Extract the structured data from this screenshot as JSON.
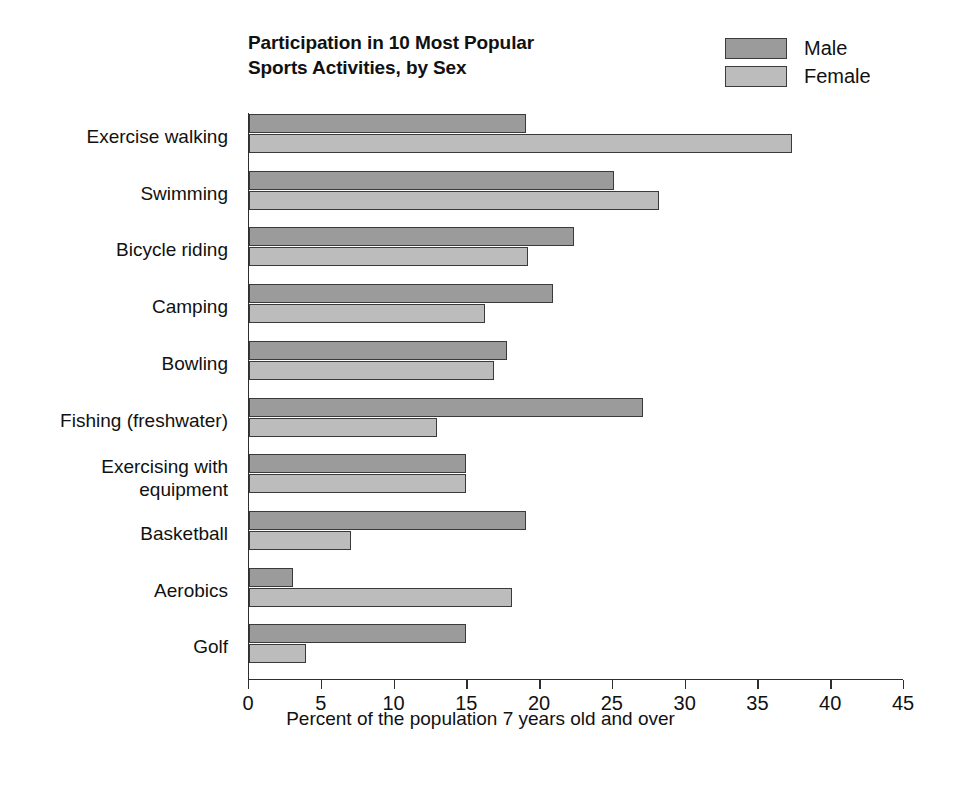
{
  "chart_data": {
    "type": "bar",
    "orientation": "horizontal",
    "title": "Participation in 10 Most Popular Sports Activities, by Sex",
    "title_line1": "Participation in 10 Most Popular",
    "title_line2": "Sports Activities, by Sex",
    "xlabel": "Percent of the population 7 years old and over",
    "ylabel": "",
    "xlim": [
      0,
      45
    ],
    "xticks": [
      0,
      5,
      10,
      15,
      20,
      25,
      30,
      35,
      40,
      45
    ],
    "grid": false,
    "legend_position": "top-right",
    "categories": [
      "Exercise walking",
      "Swimming",
      "Bicycle riding",
      "Camping",
      "Bowling",
      "Fishing (freshwater)",
      "Exercising with equipment",
      "Basketball",
      "Aerobics",
      "Golf"
    ],
    "series": [
      {
        "name": "Male",
        "color": "#9b9b9b",
        "values": [
          19.0,
          25.1,
          22.3,
          20.9,
          17.7,
          27.1,
          14.9,
          19.0,
          3.0,
          14.9
        ]
      },
      {
        "name": "Female",
        "color": "#bcbcbc",
        "values": [
          37.3,
          28.2,
          19.2,
          16.2,
          16.8,
          12.9,
          14.9,
          7.0,
          18.1,
          3.9
        ]
      }
    ]
  },
  "legend": {
    "items": [
      {
        "label": "Male",
        "swatch": "male"
      },
      {
        "label": "Female",
        "swatch": "female"
      }
    ]
  }
}
